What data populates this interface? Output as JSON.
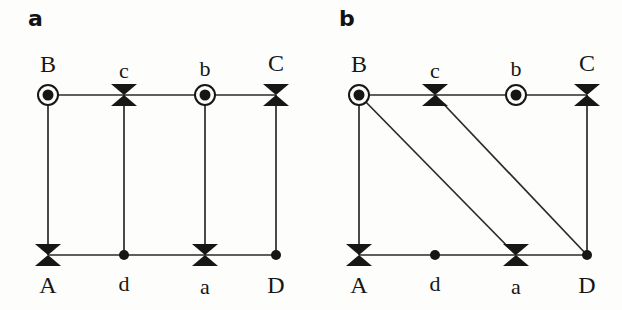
{
  "figure": {
    "background_color": "#fdfdfc",
    "ink_color": "#161616",
    "panels": [
      {
        "id": "a",
        "label": "a",
        "nodes": [
          {
            "id": "B",
            "label": "B",
            "marker": "dotted-circle",
            "x": 48,
            "y": 95,
            "label_x": 48,
            "label_y": 52,
            "label_pos": "above",
            "case": "upper"
          },
          {
            "id": "c",
            "label": "c",
            "marker": "bowtie",
            "x": 124,
            "y": 95,
            "label_x": 124,
            "label_y": 60,
            "label_pos": "above",
            "case": "lower"
          },
          {
            "id": "b",
            "label": "b",
            "marker": "dotted-circle",
            "x": 205,
            "y": 95,
            "label_x": 205,
            "label_y": 58,
            "label_pos": "above",
            "case": "lower"
          },
          {
            "id": "C",
            "label": "C",
            "marker": "bowtie",
            "x": 276,
            "y": 95,
            "label_x": 276,
            "label_y": 51,
            "label_pos": "above",
            "case": "upper"
          },
          {
            "id": "A",
            "label": "A",
            "marker": "bowtie",
            "x": 48,
            "y": 255,
            "label_x": 48,
            "label_y": 273,
            "label_pos": "below",
            "case": "upper"
          },
          {
            "id": "d",
            "label": "d",
            "marker": "filled-dot",
            "x": 124,
            "y": 255,
            "label_x": 124,
            "label_y": 273,
            "label_pos": "below",
            "case": "lower"
          },
          {
            "id": "a",
            "label": "a",
            "marker": "bowtie",
            "x": 205,
            "y": 255,
            "label_x": 205,
            "label_y": 276,
            "label_pos": "below",
            "case": "lower"
          },
          {
            "id": "D",
            "label": "D",
            "marker": "filled-dot",
            "x": 276,
            "y": 255,
            "label_x": 276,
            "label_y": 273,
            "label_pos": "below",
            "case": "upper"
          }
        ],
        "edges": [
          {
            "from": "B",
            "to": "c",
            "kind": "horizontal"
          },
          {
            "from": "c",
            "to": "b",
            "kind": "horizontal"
          },
          {
            "from": "b",
            "to": "C",
            "kind": "horizontal"
          },
          {
            "from": "A",
            "to": "d",
            "kind": "horizontal"
          },
          {
            "from": "d",
            "to": "a",
            "kind": "horizontal"
          },
          {
            "from": "a",
            "to": "D",
            "kind": "horizontal"
          },
          {
            "from": "B",
            "to": "A",
            "kind": "vertical"
          },
          {
            "from": "c",
            "to": "d",
            "kind": "vertical"
          },
          {
            "from": "b",
            "to": "a",
            "kind": "vertical"
          },
          {
            "from": "C",
            "to": "D",
            "kind": "vertical"
          }
        ]
      },
      {
        "id": "b",
        "label": "b",
        "nodes": [
          {
            "id": "B",
            "label": "B",
            "marker": "dotted-circle",
            "x": 48,
            "y": 95,
            "label_x": 48,
            "label_y": 52,
            "label_pos": "above",
            "case": "upper"
          },
          {
            "id": "c",
            "label": "c",
            "marker": "bowtie",
            "x": 124,
            "y": 95,
            "label_x": 124,
            "label_y": 60,
            "label_pos": "above",
            "case": "lower"
          },
          {
            "id": "b",
            "label": "b",
            "marker": "dotted-circle",
            "x": 205,
            "y": 95,
            "label_x": 205,
            "label_y": 58,
            "label_pos": "above",
            "case": "lower"
          },
          {
            "id": "C",
            "label": "C",
            "marker": "bowtie",
            "x": 276,
            "y": 95,
            "label_x": 276,
            "label_y": 51,
            "label_pos": "above",
            "case": "upper"
          },
          {
            "id": "A",
            "label": "A",
            "marker": "bowtie",
            "x": 48,
            "y": 255,
            "label_x": 48,
            "label_y": 273,
            "label_pos": "below",
            "case": "upper"
          },
          {
            "id": "d",
            "label": "d",
            "marker": "filled-dot",
            "x": 124,
            "y": 255,
            "label_x": 124,
            "label_y": 273,
            "label_pos": "below",
            "case": "lower"
          },
          {
            "id": "a",
            "label": "a",
            "marker": "bowtie",
            "x": 205,
            "y": 255,
            "label_x": 205,
            "label_y": 276,
            "label_pos": "below",
            "case": "lower"
          },
          {
            "id": "D",
            "label": "D",
            "marker": "filled-dot",
            "x": 276,
            "y": 255,
            "label_x": 276,
            "label_y": 273,
            "label_pos": "below",
            "case": "upper"
          }
        ],
        "edges": [
          {
            "from": "B",
            "to": "c",
            "kind": "horizontal"
          },
          {
            "from": "c",
            "to": "b",
            "kind": "horizontal"
          },
          {
            "from": "b",
            "to": "C",
            "kind": "horizontal"
          },
          {
            "from": "A",
            "to": "d",
            "kind": "horizontal"
          },
          {
            "from": "d",
            "to": "a",
            "kind": "horizontal"
          },
          {
            "from": "a",
            "to": "D",
            "kind": "horizontal"
          },
          {
            "from": "B",
            "to": "A",
            "kind": "vertical"
          },
          {
            "from": "C",
            "to": "D",
            "kind": "vertical"
          },
          {
            "from": "B",
            "to": "a",
            "kind": "diagonal"
          },
          {
            "from": "c",
            "to": "D",
            "kind": "diagonal"
          }
        ]
      }
    ],
    "marker_styles": {
      "bowtie": {
        "half_width": 13,
        "half_height": 11,
        "fill": "#161616"
      },
      "dotted-circle": {
        "outer_radius": 10,
        "outer_stroke_width": 2,
        "inner_radius": 5.5,
        "stroke": "#161616",
        "fill": "#161616"
      },
      "filled-dot": {
        "radius": 5,
        "fill": "#161616"
      }
    },
    "edge_style": {
      "stroke": "#2a2a2a",
      "stroke_width": 1.7
    }
  }
}
